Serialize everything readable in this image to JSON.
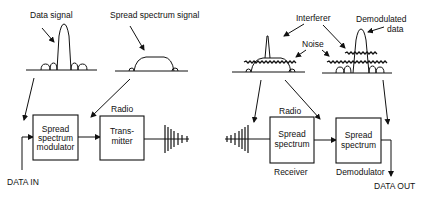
{
  "diagram": {
    "title": "",
    "spectra": {
      "data_signal": {
        "label": "Data signal"
      },
      "spread_spectrum_signal": {
        "label": "Spread spectrum signal"
      },
      "received": {
        "interferer_label": "Interferer",
        "noise_label": "Noise"
      },
      "demodulated": {
        "label_line1": "Demodulated",
        "label_line2": "data"
      }
    },
    "transmitter_chain": {
      "input_label": "DATA IN",
      "modulator": {
        "line1": "Spread",
        "line2": "spectrum",
        "line3": "modulator"
      },
      "radio_label": "Radio",
      "transmitter": {
        "line1": "Trans-",
        "line2": "mitter"
      }
    },
    "receiver_chain": {
      "radio_label": "Radio",
      "receiver": {
        "line1": "Spread",
        "line2": "spectrum",
        "caption": "Receiver"
      },
      "demodulator": {
        "line1": "Spread",
        "line2": "spectrum",
        "caption": "Demodulator"
      },
      "output_label": "DATA OUT"
    },
    "colors": {
      "ink": "#111111",
      "background": "#ffffff"
    }
  }
}
